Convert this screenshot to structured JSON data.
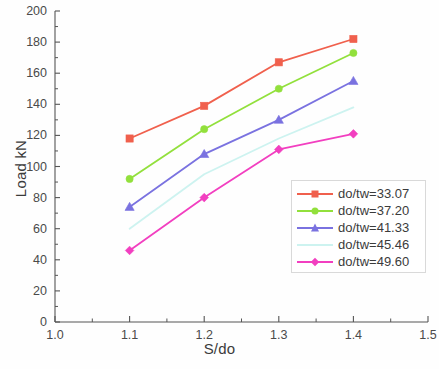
{
  "chart_data": {
    "type": "line",
    "title": "",
    "xlabel": "S/do",
    "ylabel": "Load kN",
    "xlim": [
      1.0,
      1.5
    ],
    "ylim": [
      0,
      200
    ],
    "xticks": [
      "1.0",
      "1.1",
      "1.2",
      "1.3",
      "1.4",
      "1.5"
    ],
    "xtick_values": [
      1.0,
      1.1,
      1.2,
      1.3,
      1.4,
      1.5
    ],
    "yticks": [
      "0",
      "20",
      "40",
      "60",
      "80",
      "100",
      "120",
      "140",
      "160",
      "180",
      "200"
    ],
    "ytick_values": [
      0,
      20,
      40,
      60,
      80,
      100,
      120,
      140,
      160,
      180,
      200
    ],
    "grid": false,
    "legend_position": "lower right",
    "x": [
      1.1,
      1.2,
      1.3,
      1.4
    ],
    "series": [
      {
        "name": "do/tw=33.07",
        "values": [
          118,
          139,
          167,
          182
        ],
        "color": "#f0604d",
        "marker": "square"
      },
      {
        "name": "do/tw=37.20",
        "values": [
          92,
          124,
          150,
          173
        ],
        "color": "#92e03c",
        "marker": "circle"
      },
      {
        "name": "do/tw=41.33",
        "values": [
          74,
          108,
          130,
          155
        ],
        "color": "#7a72e0",
        "marker": "triangle"
      },
      {
        "name": "do/tw=45.46",
        "values": [
          60,
          95,
          118,
          138
        ],
        "color": "#cdf3f0",
        "marker": "none"
      },
      {
        "name": "do/tw=49.60",
        "values": [
          46,
          80,
          111,
          121
        ],
        "color": "#f23fc0",
        "marker": "diamond"
      }
    ]
  },
  "axis_color": "#555555"
}
